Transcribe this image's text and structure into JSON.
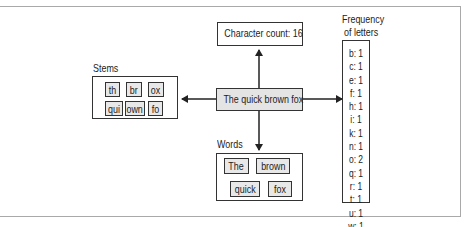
{
  "diagram": {
    "center": {
      "text": "The quick brown fox"
    },
    "character_count": {
      "text": "Character count: 16"
    },
    "stems": {
      "title": "Stems",
      "items": [
        "th",
        "br",
        "ox",
        "qui",
        "own",
        "fo"
      ]
    },
    "words": {
      "title": "Words",
      "items": [
        "The",
        "brown",
        "quick",
        "fox"
      ]
    },
    "frequency": {
      "title_line1": "Frequency",
      "title_line2": "of letters",
      "items": [
        "b: 1",
        "c: 1",
        "e: 1",
        "f: 1",
        "h: 1",
        "i: 1",
        "k: 1",
        "n: 1",
        "o: 2",
        "q: 1",
        "r: 1",
        "t: 1",
        "u: 1",
        "w: 1"
      ]
    },
    "colors": {
      "stroke": "#333333",
      "shaded_fill": "#e4e4e4",
      "chip_fill": "#e8e8e8",
      "frame": "#a9a9a9"
    }
  }
}
